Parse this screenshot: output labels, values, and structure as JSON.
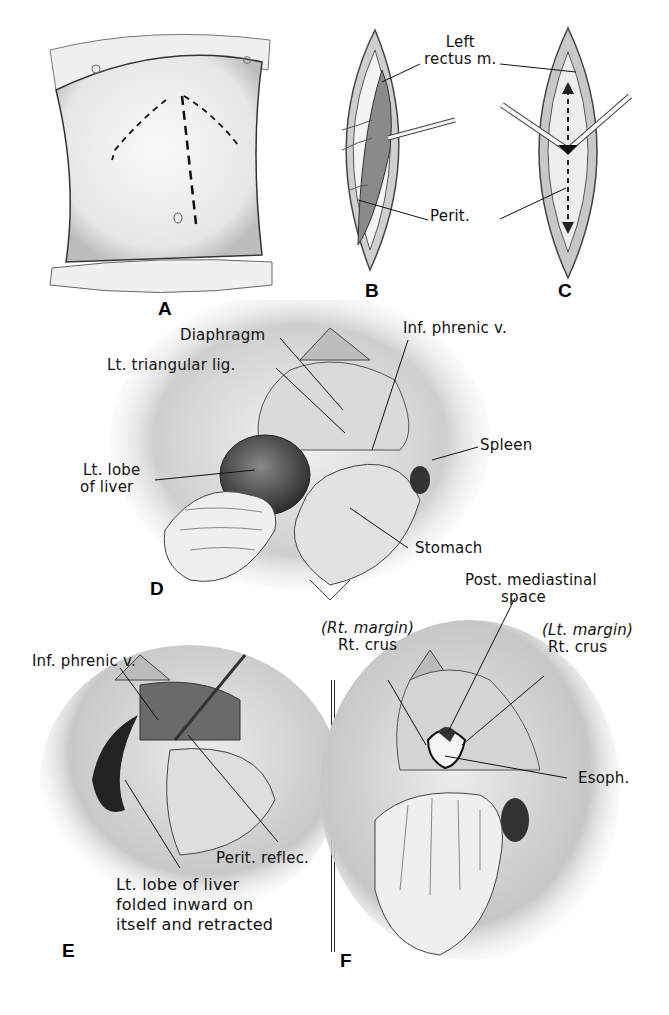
{
  "figure": {
    "panels": [
      {
        "id": "A",
        "letter": "A",
        "subject": "torso-with-incision-lines",
        "labels": []
      },
      {
        "id": "B",
        "letter": "B",
        "subject": "incision-left-rectus",
        "labels": [
          {
            "text": "Left",
            "line2": "rectus m."
          },
          {
            "text": "Perit."
          }
        ]
      },
      {
        "id": "C",
        "letter": "C",
        "subject": "peritoneum-opened",
        "labels": []
      },
      {
        "id": "D",
        "letter": "D",
        "subject": "upper-abdomen-exposed",
        "labels": [
          {
            "text": "Diaphragm"
          },
          {
            "text": "Lt. triangular lig."
          },
          {
            "text": "Inf. phrenic v."
          },
          {
            "text": "Lt. lobe",
            "line2": "of liver"
          },
          {
            "text": "Spleen"
          },
          {
            "text": "Stomach"
          }
        ]
      },
      {
        "id": "E",
        "letter": "E",
        "subject": "liver-retracted",
        "labels": [
          {
            "text": "Inf. phrenic v."
          },
          {
            "text": "Perit. reflec."
          },
          {
            "text": "Lt. lobe of liver",
            "line2": "folded inward on",
            "line3": "itself and retracted"
          }
        ]
      },
      {
        "id": "F",
        "letter": "F",
        "subject": "esophageal-hiatus",
        "labels": [
          {
            "text": "Post. mediastinal",
            "line2": "space"
          },
          {
            "text": "(Rt. margin)",
            "line2": "Rt. crus"
          },
          {
            "text": "(Lt. margin)",
            "line2": "Rt. crus"
          },
          {
            "text": "Esoph."
          }
        ]
      }
    ]
  },
  "colors": {
    "ink": "#111111",
    "paper": "#ffffff",
    "shade_light": "#dcdcdc",
    "shade_mid": "#a8a8a8",
    "shade_dark": "#4a4a4a"
  }
}
